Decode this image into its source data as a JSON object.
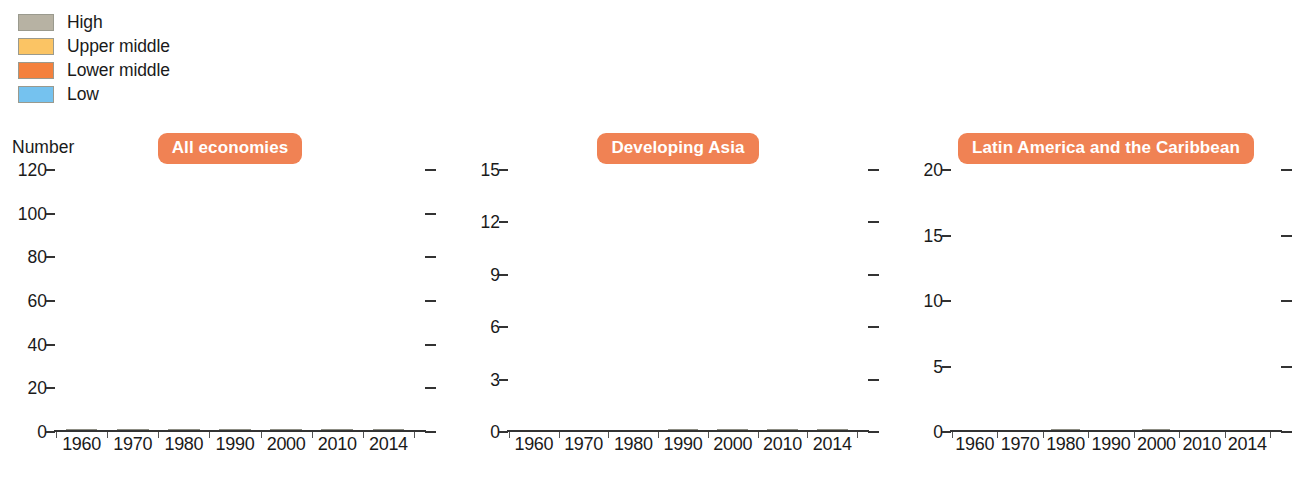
{
  "legend": {
    "items": [
      {
        "label": "High",
        "color": "#b7b2a3"
      },
      {
        "label": "Upper middle",
        "color": "#fbc464"
      },
      {
        "label": "Lower middle",
        "color": "#f4813d"
      },
      {
        "label": "Low",
        "color": "#75c2ef"
      }
    ]
  },
  "axis_unit_label": "Number",
  "chart_data": {
    "type": "bar",
    "subtype": "stacked-bar",
    "title": "",
    "xlabel": "",
    "ylabel": "Number",
    "grid": false,
    "legend_position": "top-left",
    "categories": [
      "1960",
      "1970",
      "1980",
      "1990",
      "2000",
      "2010",
      "2014"
    ],
    "series_order": [
      "Low",
      "Lower middle",
      "Upper middle",
      "High"
    ],
    "series_colors": {
      "Low": "#75c2ef",
      "Lower middle": "#f4813d",
      "Upper middle": "#fbc464",
      "High": "#b7b2a3"
    },
    "panels": [
      {
        "name": "All economies",
        "ylim": [
          0,
          120
        ],
        "yticks": [
          0,
          20,
          40,
          60,
          80,
          100,
          120
        ],
        "ytick_labels": [
          "0",
          "20",
          "40",
          "60",
          "80",
          "100",
          "120"
        ],
        "series": [
          {
            "name": "Low",
            "values": [
              55,
              45,
              41,
              40,
              34,
              26,
              23
            ]
          },
          {
            "name": "Lower middle",
            "values": [
              25,
              22,
              16,
              17,
              17,
              10,
              12
            ]
          },
          {
            "name": "Upper middle",
            "values": [
              23,
              30,
              30,
              22,
              24,
              35,
              31
            ]
          },
          {
            "name": "High",
            "values": [
              2,
              8,
              18,
              26,
              30,
              34,
              39
            ]
          }
        ],
        "totals": [
          105,
          105,
          105,
          105,
          105,
          105,
          105
        ]
      },
      {
        "name": "Developing Asia",
        "ylim": [
          0,
          15
        ],
        "yticks": [
          0,
          3,
          6,
          9,
          12,
          15
        ],
        "ytick_labels": [
          "0",
          "3",
          "6",
          "9",
          "12",
          "15"
        ],
        "series": [
          {
            "name": "Low",
            "values": [
              9.6,
              8.8,
              6.8,
              4.9,
              2.9,
              1.9,
              0.7
            ]
          },
          {
            "name": "Lower middle",
            "values": [
              5.4,
              4.0,
              3.0,
              3.9,
              4.9,
              1.9,
              3.1
            ]
          },
          {
            "name": "Upper middle",
            "values": [
              0,
              2.2,
              5.2,
              3.0,
              3.0,
              5.9,
              5.9
            ]
          },
          {
            "name": "High",
            "values": [
              0,
              0,
              0,
              3.2,
              4.2,
              5.3,
              5.3
            ]
          }
        ],
        "totals": [
          15,
          15,
          15,
          15,
          15,
          15,
          15
        ]
      },
      {
        "name": "Latin America and the Caribbean",
        "ylim": [
          0,
          20
        ],
        "yticks": [
          0,
          5,
          10,
          15,
          20
        ],
        "ytick_labels": [
          "0",
          "5",
          "10",
          "15",
          "20"
        ],
        "series": [
          {
            "name": "Low",
            "values": [
              8.0,
              4.0,
              1.8,
              1.8,
              0.7,
              0,
              0
            ]
          },
          {
            "name": "Lower middle",
            "values": [
              6.8,
              7.7,
              7.2,
              7.2,
              6.1,
              1.6,
              1.5
            ]
          },
          {
            "name": "Upper middle",
            "values": [
              5.0,
              8.1,
              10.0,
              11.0,
              12.0,
              15.0,
              13.2
            ]
          },
          {
            "name": "High",
            "values": [
              0,
              0,
              0.8,
              0,
              1.0,
              3.2,
              5.1
            ]
          }
        ],
        "totals": [
          19.8,
          19.8,
          19.8,
          19.8,
          19.8,
          19.8,
          19.8
        ]
      }
    ]
  }
}
